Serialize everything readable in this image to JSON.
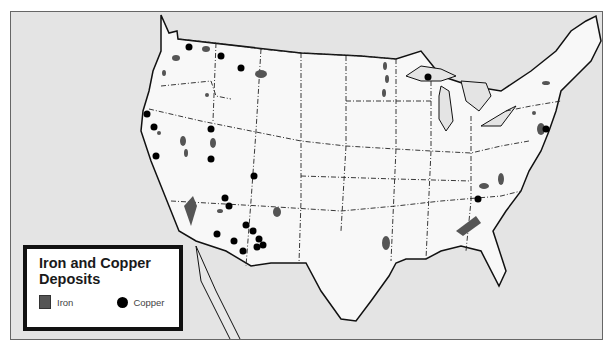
{
  "map": {
    "title": "Iron and Copper Deposits",
    "region": "Contiguous United States",
    "colors": {
      "water": "#e4e4e4",
      "land": "#f8f8f8",
      "iron": "#555555",
      "copper": "#000000",
      "border": "#111111"
    }
  },
  "legend": {
    "title_line1": "Iron and Copper",
    "title_line2": "Deposits",
    "items": [
      {
        "label": "Iron",
        "symbol": "gray-square"
      },
      {
        "label": "Copper",
        "symbol": "black-dot"
      }
    ]
  },
  "deposits": {
    "copper": [
      [
        188,
        46
      ],
      [
        220,
        55
      ],
      [
        240,
        67
      ],
      [
        146,
        113
      ],
      [
        153,
        126
      ],
      [
        210,
        128
      ],
      [
        155,
        155
      ],
      [
        210,
        158
      ],
      [
        253,
        175
      ],
      [
        224,
        197
      ],
      [
        228,
        205
      ],
      [
        245,
        224
      ],
      [
        216,
        233
      ],
      [
        252,
        230
      ],
      [
        258,
        238
      ],
      [
        265,
        244
      ],
      [
        233,
        240
      ],
      [
        245,
        248
      ],
      [
        256,
        246
      ],
      [
        427,
        76
      ],
      [
        545,
        128
      ],
      [
        477,
        198
      ]
    ],
    "iron": [
      [
        175,
        57
      ],
      [
        205,
        48
      ],
      [
        260,
        73
      ],
      [
        163,
        72
      ],
      [
        206,
        94
      ],
      [
        158,
        132
      ],
      [
        182,
        140
      ],
      [
        212,
        142
      ],
      [
        185,
        152
      ],
      [
        180,
        168
      ],
      [
        192,
        203
      ],
      [
        219,
        210
      ],
      [
        255,
        225
      ],
      [
        276,
        211
      ],
      [
        385,
        242
      ],
      [
        391,
        232
      ],
      [
        384,
        65
      ],
      [
        386,
        78
      ],
      [
        383,
        92
      ],
      [
        535,
        82
      ],
      [
        533,
        112
      ],
      [
        540,
        118
      ],
      [
        483,
        185
      ],
      [
        487,
        208
      ],
      [
        460,
        222
      ],
      [
        470,
        230
      ],
      [
        500,
        180
      ]
    ]
  }
}
